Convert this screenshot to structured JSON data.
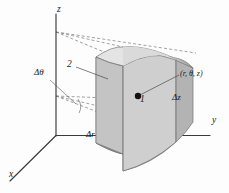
{
  "figure": {
    "background_color": "#fdfdfd",
    "ink_color": "#1a1a1a"
  },
  "axes": {
    "z_label": "z",
    "y_label": "y",
    "x_label": "x",
    "origin": {
      "x": 56,
      "y": 135
    },
    "z_tip": {
      "x": 56,
      "y": 14
    },
    "y_tip": {
      "x": 210,
      "y": 135
    },
    "x_tip": {
      "x": 8,
      "y": 182
    }
  },
  "labels": {
    "delta_theta": "Δθ",
    "delta_r": "Δr",
    "delta_z": "Δz",
    "face_two": "2",
    "face_one": "1",
    "point": "(r, θ, z)"
  },
  "solid": {
    "name": "cylindrical-wedge",
    "top_face_color": "#e2e2e2",
    "front_face_color": "#c9c9c9",
    "right_face_color": "#b4b4b4",
    "left_face_color": "#a9a9a9",
    "bottom_face_color": "#9c9c9c",
    "edge_color": "#6e6e6e"
  },
  "markers": {
    "center_dot": {
      "x": 138,
      "y": 96,
      "radius": 3.2,
      "color": "#111111"
    }
  },
  "dashed_lines": {
    "color": "#777777",
    "dash_pattern": "3,2.2",
    "upper_apex": {
      "x": 56,
      "y": 32
    },
    "lower_apex": {
      "x": 56,
      "y": 96
    }
  }
}
